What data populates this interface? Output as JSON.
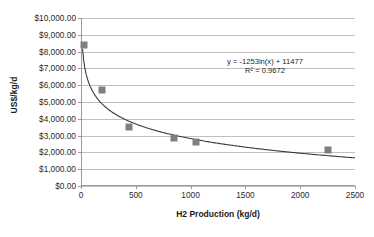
{
  "chart_data": {
    "type": "scatter",
    "title": "",
    "xlabel": "H2 Production (kg/d)",
    "ylabel": "US$/kg/d",
    "xlim": [
      0,
      2500
    ],
    "ylim": [
      0,
      10000
    ],
    "grid": true,
    "legend": "none",
    "x_ticks": [
      "0",
      "500",
      "1000",
      "1500",
      "2000",
      "2500"
    ],
    "x_tick_values": [
      0,
      500,
      1000,
      1500,
      2000,
      2500
    ],
    "y_ticks": [
      "$0.00",
      "$1,000.00",
      "$2,000.00",
      "$3,000.00",
      "$4,000.00",
      "$5,000.00",
      "$6,000.00",
      "$7,000.00",
      "$8,000.00",
      "$9,000.00",
      "$10,000.00"
    ],
    "y_tick_values": [
      0,
      1000,
      2000,
      3000,
      4000,
      5000,
      6000,
      7000,
      8000,
      9000,
      10000
    ],
    "series": [
      {
        "name": "Hydrogen capital cost",
        "marker": "square",
        "color": "#808080",
        "points": [
          {
            "x": 30,
            "y": 8400
          },
          {
            "x": 195,
            "y": 5700
          },
          {
            "x": 440,
            "y": 3500
          },
          {
            "x": 850,
            "y": 2850
          },
          {
            "x": 1050,
            "y": 2600
          },
          {
            "x": 2250,
            "y": 2150
          }
        ]
      }
    ],
    "trendline": {
      "type": "logarithmic",
      "equation": "y = -1253ln(x) + 11477",
      "r_squared_label": "R² = 0.9672",
      "r_squared": 0.9672,
      "coefficient": -1253,
      "intercept": 11477,
      "color": "#3a3a3a"
    },
    "annotations": [
      {
        "name": "trendline-equation",
        "text": "y = -1253ln(x) + 11477"
      },
      {
        "name": "trendline-r-squared",
        "text": "R² = 0.9672"
      }
    ]
  }
}
